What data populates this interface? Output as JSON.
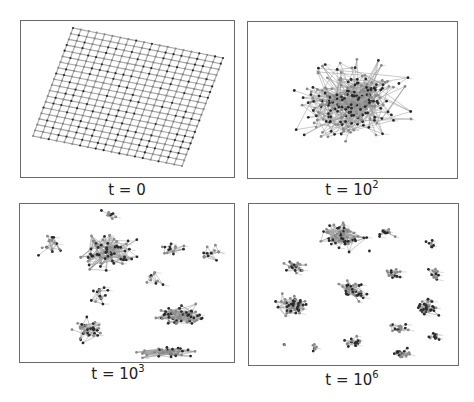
{
  "figure": {
    "panels": [
      {
        "id": "t0",
        "label_prefix": "t = ",
        "label_base": "0",
        "label_exp": "",
        "box": {
          "x": 20,
          "y": 20,
          "w": 215,
          "h": 158
        },
        "caption_pos": {
          "cx": 127,
          "y": 180
        },
        "layout": "lattice",
        "lattice": {
          "rows": 20,
          "cols": 20,
          "corners": {
            "tl": [
              52,
              7
            ],
            "tr": [
              202,
              37
            ],
            "br": [
              161,
              145
            ],
            "bl": [
              12,
              115
            ]
          }
        }
      },
      {
        "id": "t1e2",
        "label_prefix": "t = ",
        "label_base": "10",
        "label_exp": "2",
        "box": {
          "x": 247,
          "y": 21,
          "w": 211,
          "h": 158
        },
        "caption_pos": {
          "cx": 352,
          "y": 180
        },
        "layout": "clusters",
        "seed": 7,
        "clusters": [
          {
            "cx": 105,
            "cy": 80,
            "rx": 72,
            "ry": 50,
            "n": 260,
            "edges": 1.6,
            "reach": 48
          }
        ]
      },
      {
        "id": "t1e3",
        "label_prefix": "t = ",
        "label_base": "10",
        "label_exp": "3",
        "box": {
          "x": 19,
          "y": 203,
          "w": 216,
          "h": 160
        },
        "caption_pos": {
          "cx": 118,
          "y": 364
        },
        "layout": "clusters",
        "seed": 13,
        "clusters": [
          {
            "cx": 85,
            "cy": 50,
            "rx": 38,
            "ry": 22,
            "n": 70,
            "edges": 2.2,
            "reach": 40
          },
          {
            "cx": 30,
            "cy": 42,
            "rx": 16,
            "ry": 14,
            "n": 16,
            "edges": 1.4,
            "reach": 55
          },
          {
            "cx": 90,
            "cy": 10,
            "rx": 14,
            "ry": 7,
            "n": 10,
            "edges": 1.2,
            "reach": 20
          },
          {
            "cx": 150,
            "cy": 45,
            "rx": 18,
            "ry": 12,
            "n": 14,
            "edges": 1.4,
            "reach": 30
          },
          {
            "cx": 195,
            "cy": 50,
            "rx": 16,
            "ry": 18,
            "n": 12,
            "edges": 1.2,
            "reach": 35
          },
          {
            "cx": 135,
            "cy": 75,
            "rx": 14,
            "ry": 12,
            "n": 10,
            "edges": 1.2,
            "reach": 35
          },
          {
            "cx": 158,
            "cy": 112,
            "rx": 30,
            "ry": 16,
            "n": 60,
            "edges": 2.0,
            "reach": 40
          },
          {
            "cx": 70,
            "cy": 125,
            "rx": 24,
            "ry": 18,
            "n": 34,
            "edges": 1.6,
            "reach": 45
          },
          {
            "cx": 145,
            "cy": 148,
            "rx": 40,
            "ry": 8,
            "n": 40,
            "edges": 1.8,
            "reach": 60
          },
          {
            "cx": 80,
            "cy": 95,
            "rx": 14,
            "ry": 20,
            "n": 14,
            "edges": 1.2,
            "reach": 50
          }
        ]
      },
      {
        "id": "t1e6",
        "label_prefix": "t = ",
        "label_base": "10",
        "label_exp": "6",
        "box": {
          "x": 248,
          "y": 203,
          "w": 211,
          "h": 163
        },
        "caption_pos": {
          "cx": 352,
          "y": 370
        },
        "layout": "clusters",
        "seed": 21,
        "clusters": [
          {
            "cx": 93,
            "cy": 33,
            "rx": 26,
            "ry": 20,
            "n": 60,
            "edges": 1.8,
            "reach": 26
          },
          {
            "cx": 45,
            "cy": 62,
            "rx": 14,
            "ry": 11,
            "n": 22,
            "edges": 1.5,
            "reach": 18
          },
          {
            "cx": 43,
            "cy": 102,
            "rx": 22,
            "ry": 14,
            "n": 45,
            "edges": 1.8,
            "reach": 20
          },
          {
            "cx": 102,
            "cy": 86,
            "rx": 20,
            "ry": 15,
            "n": 38,
            "edges": 1.7,
            "reach": 22
          },
          {
            "cx": 137,
            "cy": 28,
            "rx": 12,
            "ry": 8,
            "n": 12,
            "edges": 1.3,
            "reach": 14
          },
          {
            "cx": 182,
            "cy": 40,
            "rx": 8,
            "ry": 6,
            "n": 8,
            "edges": 1.2,
            "reach": 10
          },
          {
            "cx": 142,
            "cy": 70,
            "rx": 13,
            "ry": 9,
            "n": 16,
            "edges": 1.3,
            "reach": 14
          },
          {
            "cx": 188,
            "cy": 70,
            "rx": 10,
            "ry": 11,
            "n": 14,
            "edges": 1.3,
            "reach": 14
          },
          {
            "cx": 176,
            "cy": 103,
            "rx": 18,
            "ry": 13,
            "n": 32,
            "edges": 1.6,
            "reach": 18
          },
          {
            "cx": 150,
            "cy": 124,
            "rx": 12,
            "ry": 9,
            "n": 18,
            "edges": 1.5,
            "reach": 12
          },
          {
            "cx": 185,
            "cy": 133,
            "rx": 9,
            "ry": 8,
            "n": 12,
            "edges": 1.3,
            "reach": 10
          },
          {
            "cx": 105,
            "cy": 138,
            "rx": 13,
            "ry": 8,
            "n": 18,
            "edges": 1.5,
            "reach": 12
          },
          {
            "cx": 153,
            "cy": 150,
            "rx": 12,
            "ry": 7,
            "n": 18,
            "edges": 1.5,
            "reach": 12
          },
          {
            "cx": 64,
            "cy": 142,
            "rx": 8,
            "ry": 8,
            "n": 7,
            "edges": 1.0,
            "reach": 14
          },
          {
            "cx": 35,
            "cy": 140,
            "rx": 2,
            "ry": 2,
            "n": 2,
            "edges": 1.0,
            "reach": 6
          },
          {
            "cx": 120,
            "cy": 47,
            "rx": 1,
            "ry": 1,
            "n": 1,
            "edges": 0,
            "reach": 1
          }
        ]
      }
    ],
    "colors": {
      "edge": "#9a9a9a",
      "node_dark": "#2a2a2a",
      "node_light": "#8a8a8a",
      "frame": "#6a6a6a",
      "text": "#222222"
    }
  }
}
